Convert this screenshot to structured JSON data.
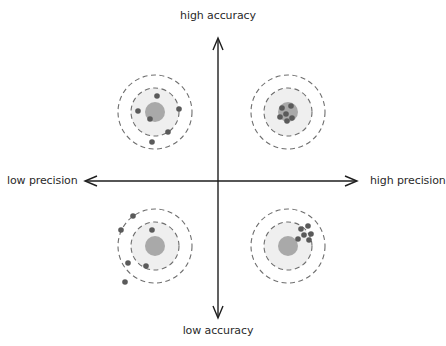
{
  "diagram": {
    "axes": {
      "top_label": "high accuracy",
      "bottom_label": "low accuracy",
      "left_label": "low precision",
      "right_label": "high precision"
    },
    "colors": {
      "axis": "#1e1e1e",
      "dashed_ring": "#6e6e6e",
      "target_fill": "#efefef",
      "bullseye": "#a9a9a9",
      "dot": "#5a5a5a",
      "text": "#2a2a2a"
    },
    "targets": [
      {
        "id": "high-accuracy-low-precision",
        "quadrant": "top-left",
        "center": [
          155,
          112
        ],
        "dots": [
          [
            157,
            96
          ],
          [
            138,
            111
          ],
          [
            179,
            109
          ],
          [
            150,
            119
          ],
          [
            168,
            132
          ],
          [
            152,
            142
          ]
        ]
      },
      {
        "id": "high-accuracy-high-precision",
        "quadrant": "top-right",
        "center": [
          288,
          112
        ],
        "dots": [
          [
            282,
            108
          ],
          [
            291,
            106
          ],
          [
            286,
            114
          ],
          [
            280,
            117
          ],
          [
            292,
            118
          ],
          [
            287,
            121
          ]
        ]
      },
      {
        "id": "low-accuracy-low-precision",
        "quadrant": "bottom-left",
        "center": [
          155,
          246
        ],
        "dots": [
          [
            133,
            216
          ],
          [
            121,
            230
          ],
          [
            152,
            230
          ],
          [
            128,
            263
          ],
          [
            146,
            266
          ],
          [
            125,
            282
          ]
        ]
      },
      {
        "id": "low-accuracy-high-precision",
        "quadrant": "bottom-right",
        "center": [
          288,
          246
        ],
        "dots": [
          [
            301,
            229
          ],
          [
            308,
            226
          ],
          [
            304,
            235
          ],
          [
            311,
            234
          ],
          [
            298,
            239
          ],
          [
            309,
            240
          ]
        ]
      }
    ]
  }
}
